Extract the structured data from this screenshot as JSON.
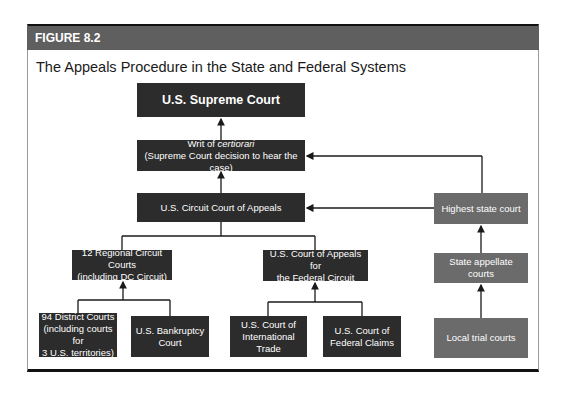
{
  "figure": {
    "label": "FIGURE 8.2",
    "title": "The Appeals Procedure in the State and Federal Systems"
  },
  "federal": {
    "supreme": "U.S. Supreme Court",
    "writ_line1_prefix": "Writ of ",
    "writ_line1_italic": "certiorari",
    "writ_line2": "(Supreme Court decision to hear the case)",
    "circuit_appeals": "U.S. Circuit Court of Appeals",
    "regional_line1": "12 Regional Circuit Courts",
    "regional_line2": "(including DC Circuit)",
    "fed_circuit_line1": "U.S. Court of Appeals for",
    "fed_circuit_line2": "the Federal Circuit",
    "district_line1": "94 District Courts",
    "district_line2": "(including courts for",
    "district_line3": "3 U.S. territories)",
    "bankruptcy_line1": "U.S. Bankruptcy",
    "bankruptcy_line2": "Court",
    "intl_trade_line1": "U.S. Court of",
    "intl_trade_line2": "International Trade",
    "fed_claims_line1": "U.S. Court of",
    "fed_claims_line2": "Federal Claims"
  },
  "state": {
    "highest": "Highest state court",
    "appellate": "State appellate courts",
    "trial": "Local trial courts"
  },
  "colors": {
    "federal_box": "#2c2c2c",
    "state_box": "#6b6b6b",
    "header_band": "#5f5f5f"
  }
}
